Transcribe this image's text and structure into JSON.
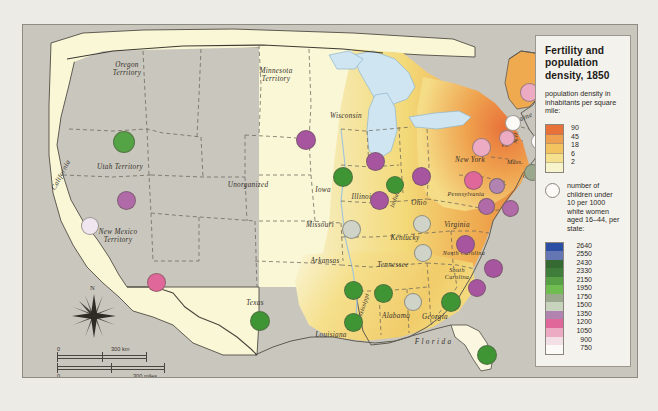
{
  "legend": {
    "title": "Fertility and population density, 1850",
    "density_heading": "population density in inhabitants per square mile:",
    "density_labels": [
      "90",
      "45",
      "18",
      "6",
      "2"
    ],
    "density_colors": [
      "#e8713a",
      "#eea04e",
      "#f2c35e",
      "#f5e08d",
      "#f7f3cb"
    ],
    "fertility_heading": "number of children under 10 per 1000 white women aged 16–44, per state:",
    "fertility_labels": [
      "2640",
      "2550",
      "2430",
      "2330",
      "2150",
      "1950",
      "1750",
      "1500",
      "1350",
      "1200",
      "1050",
      "900",
      "750"
    ],
    "fertility_colors": [
      "#2b4fa2",
      "#6477b4",
      "#356b33",
      "#3f7e3a",
      "#57a045",
      "#6fbd51",
      "#9aa88e",
      "#c8d3bd",
      "#b083b0",
      "#e0679a",
      "#ecabc3",
      "#f3dfe6",
      "#fbfaf7"
    ],
    "symbol_name": "fertility-circle-symbol"
  },
  "map": {
    "scale_km": {
      "zero": "0",
      "value": "300 km"
    },
    "scale_miles": {
      "zero": "0",
      "value": "300 miles"
    },
    "north_label": "N",
    "places": [
      {
        "name": "Oregon Territory",
        "lines": [
          "Oregon",
          "Territory"
        ],
        "x": 104,
        "y": 44,
        "size": "md",
        "italic": true
      },
      {
        "name": "Utah Territory",
        "lines": [
          "Utah Territory"
        ],
        "x": 97,
        "y": 142,
        "size": "md",
        "italic": true
      },
      {
        "name": "California",
        "lines": [
          "California"
        ],
        "x": 38,
        "y": 150,
        "size": "md",
        "italic": true,
        "rot": -62
      },
      {
        "name": "New Mexico Territory",
        "lines": [
          "New Mexico",
          "Territory"
        ],
        "x": 95,
        "y": 211,
        "size": "md",
        "italic": true
      },
      {
        "name": "Minnesota Territory",
        "lines": [
          "Minnesota",
          "Territory"
        ],
        "x": 253,
        "y": 50,
        "size": "md",
        "italic": true
      },
      {
        "name": "Unorganized",
        "lines": [
          "Unorganized"
        ],
        "x": 225,
        "y": 160,
        "size": "md",
        "italic": true
      },
      {
        "name": "Wisconsin",
        "lines": [
          "Wisconsin"
        ],
        "x": 323,
        "y": 91,
        "size": "md",
        "italic": true
      },
      {
        "name": "Iowa",
        "lines": [
          "Iowa"
        ],
        "x": 300,
        "y": 165,
        "size": "md",
        "italic": true
      },
      {
        "name": "Illinois",
        "lines": [
          "Illinois"
        ],
        "x": 340,
        "y": 172,
        "size": "md",
        "italic": true
      },
      {
        "name": "Missouri",
        "lines": [
          "Missouri"
        ],
        "x": 297,
        "y": 200,
        "size": "md",
        "italic": true
      },
      {
        "name": "Indiana",
        "lines": [
          "Indiana"
        ],
        "x": 372,
        "y": 172,
        "size": "sm",
        "italic": true,
        "rot": -70
      },
      {
        "name": "Ohio",
        "lines": [
          "Ohio"
        ],
        "x": 396,
        "y": 178,
        "size": "md",
        "italic": true
      },
      {
        "name": "Kentucky",
        "lines": [
          "Kentucky"
        ],
        "x": 382,
        "y": 213,
        "size": "md",
        "italic": true
      },
      {
        "name": "Tennessee",
        "lines": [
          "Tennessee"
        ],
        "x": 370,
        "y": 240,
        "size": "md",
        "italic": true
      },
      {
        "name": "Arkansas",
        "lines": [
          "Arkansas"
        ],
        "x": 302,
        "y": 236,
        "size": "md",
        "italic": true
      },
      {
        "name": "Texas",
        "lines": [
          "Texas"
        ],
        "x": 232,
        "y": 278,
        "size": "md",
        "italic": true
      },
      {
        "name": "Louisiana",
        "lines": [
          "Louisiana"
        ],
        "x": 308,
        "y": 310,
        "size": "md",
        "italic": true
      },
      {
        "name": "Mississippi",
        "lines": [
          "Mississippi"
        ],
        "x": 339,
        "y": 283,
        "size": "sm",
        "italic": true,
        "rot": -72
      },
      {
        "name": "Alabama",
        "lines": [
          "Alabama"
        ],
        "x": 373,
        "y": 291,
        "size": "md",
        "italic": true
      },
      {
        "name": "Georgia",
        "lines": [
          "Georgia"
        ],
        "x": 412,
        "y": 292,
        "size": "md",
        "italic": true
      },
      {
        "name": "Florida",
        "lines": [
          "F l o r i d a"
        ],
        "x": 410,
        "y": 317,
        "size": "md",
        "italic": true
      },
      {
        "name": "South Carolina",
        "lines": [
          "South",
          "Carolina"
        ],
        "x": 434,
        "y": 248,
        "size": "sm",
        "italic": true
      },
      {
        "name": "North Carolina",
        "lines": [
          "North Carolina"
        ],
        "x": 441,
        "y": 227,
        "size": "sm",
        "italic": true
      },
      {
        "name": "Virginia",
        "lines": [
          "Virginia"
        ],
        "x": 434,
        "y": 200,
        "size": "md",
        "italic": true
      },
      {
        "name": "Pennsylvania",
        "lines": [
          "Pennsylvania"
        ],
        "x": 443,
        "y": 168,
        "size": "sm",
        "italic": true
      },
      {
        "name": "New York",
        "lines": [
          "New York"
        ],
        "x": 447,
        "y": 135,
        "size": "md",
        "italic": true
      },
      {
        "name": "Maine",
        "lines": [
          "Maine"
        ],
        "x": 500,
        "y": 93,
        "size": "md",
        "italic": true,
        "rot": -22
      },
      {
        "name": "Mass.",
        "lines": [
          "Mass."
        ],
        "x": 492,
        "y": 136,
        "size": "sm",
        "italic": true
      },
      {
        "name": "Vt.",
        "lines": [
          "Vt."
        ],
        "x": 482,
        "y": 119,
        "size": "sm",
        "italic": true
      },
      {
        "name": "N.H.",
        "lines": [
          "N.H."
        ],
        "x": 492,
        "y": 112,
        "size": "sm",
        "italic": true,
        "rot": -84
      },
      {
        "name": "R.I.",
        "lines": [
          "R.I."
        ],
        "x": 521,
        "y": 158,
        "size": "sm",
        "italic": true
      },
      {
        "name": "Conn.",
        "lines": [
          "Conn."
        ],
        "x": 508,
        "y": 150,
        "size": "sm",
        "italic": true
      },
      {
        "name": "N.J.",
        "lines": [
          "N.J."
        ],
        "x": 478,
        "y": 157,
        "size": "sm",
        "italic": true
      },
      {
        "name": "M.D.",
        "lines": [
          "M.D."
        ],
        "x": 466,
        "y": 177,
        "size": "sm",
        "italic": true
      },
      {
        "name": "Del.",
        "lines": [
          "Del."
        ],
        "x": 487,
        "y": 180,
        "size": "sm",
        "italic": true
      }
    ],
    "fertility_markers": [
      {
        "state": "Oregon Territory",
        "x": 101,
        "y": 117,
        "r": 11,
        "color": "#54a345"
      },
      {
        "state": "Utah Territory",
        "x": 103,
        "y": 175,
        "r": 9.5,
        "color": "#b06aa8"
      },
      {
        "state": "California",
        "x": 67,
        "y": 201,
        "r": 9,
        "color": "#f0e6f0"
      },
      {
        "state": "New Mexico Territory",
        "x": 133,
        "y": 257,
        "r": 9.5,
        "color": "#e0679a"
      },
      {
        "state": "Minnesota Territory",
        "x": 283,
        "y": 115,
        "r": 10,
        "color": "#a855a0"
      },
      {
        "state": "Wisconsin",
        "x": 352,
        "y": 136,
        "r": 9.5,
        "color": "#a855a0"
      },
      {
        "state": "Iowa",
        "x": 320,
        "y": 152,
        "r": 10,
        "color": "#3f9434"
      },
      {
        "state": "Illinois",
        "x": 356,
        "y": 175,
        "r": 9.5,
        "color": "#a855a0"
      },
      {
        "state": "Missouri",
        "x": 328,
        "y": 204,
        "r": 9.5,
        "color": "#cfd3c8"
      },
      {
        "state": "Indiana",
        "x": 372,
        "y": 160,
        "r": 9,
        "color": "#3f9434"
      },
      {
        "state": "Ohio",
        "x": 398,
        "y": 151,
        "r": 9.5,
        "color": "#a855a0"
      },
      {
        "state": "Kentucky",
        "x": 399,
        "y": 199,
        "r": 9,
        "color": "#cfd3c8"
      },
      {
        "state": "Tennessee",
        "x": 400,
        "y": 228,
        "r": 9,
        "color": "#cfd3c8"
      },
      {
        "state": "Arkansas",
        "x": 330,
        "y": 265,
        "r": 9.5,
        "color": "#3f9434"
      },
      {
        "state": "Texas",
        "x": 237,
        "y": 296,
        "r": 10,
        "color": "#3f9434"
      },
      {
        "state": "Louisiana",
        "x": 330,
        "y": 297,
        "r": 9.5,
        "color": "#3f9434"
      },
      {
        "state": "Mississippi",
        "x": 360,
        "y": 268,
        "r": 9.5,
        "color": "#3f9434"
      },
      {
        "state": "Alabama",
        "x": 390,
        "y": 277,
        "r": 9,
        "color": "#cfd3c8"
      },
      {
        "state": "Georgia",
        "x": 428,
        "y": 277,
        "r": 10,
        "color": "#3f9434"
      },
      {
        "state": "Florida",
        "x": 464,
        "y": 330,
        "r": 10,
        "color": "#3f9434"
      },
      {
        "state": "South Carolina",
        "x": 454,
        "y": 263,
        "r": 9,
        "color": "#a855a0"
      },
      {
        "state": "North Carolina",
        "x": 470,
        "y": 243,
        "r": 9.5,
        "color": "#a855a0"
      },
      {
        "state": "Virginia",
        "x": 442,
        "y": 219,
        "r": 9.5,
        "color": "#a855a0"
      },
      {
        "state": "Pennsylvania",
        "x": 450,
        "y": 155,
        "r": 9.5,
        "color": "#e0679a"
      },
      {
        "state": "New York",
        "x": 458,
        "y": 122,
        "r": 9.5,
        "color": "#ecabc3"
      },
      {
        "state": "Maine",
        "x": 506,
        "y": 67,
        "r": 9.5,
        "color": "#ecabc3"
      },
      {
        "state": "Vt.",
        "x": 484,
        "y": 113,
        "r": 8,
        "color": "#ecabc3"
      },
      {
        "state": "N.H.",
        "x": 490,
        "y": 98,
        "r": 8,
        "color": "#fbfaf7"
      },
      {
        "state": "Mass.",
        "x": 516,
        "y": 116,
        "r": 8.5,
        "color": "#ffffff"
      },
      {
        "state": "R.I.",
        "x": 529,
        "y": 152,
        "r": 8.5,
        "color": "#9aa88e"
      },
      {
        "state": "Conn.",
        "x": 509,
        "y": 147,
        "r": 8.5,
        "color": "#9aa88e"
      },
      {
        "state": "N.J.",
        "x": 474,
        "y": 161,
        "r": 8,
        "color": "#b083b0"
      },
      {
        "state": "M.D.",
        "x": 463,
        "y": 181,
        "r": 8.5,
        "color": "#b06aa8"
      },
      {
        "state": "Del.",
        "x": 487,
        "y": 183,
        "r": 8.5,
        "color": "#b06aa8"
      }
    ]
  }
}
